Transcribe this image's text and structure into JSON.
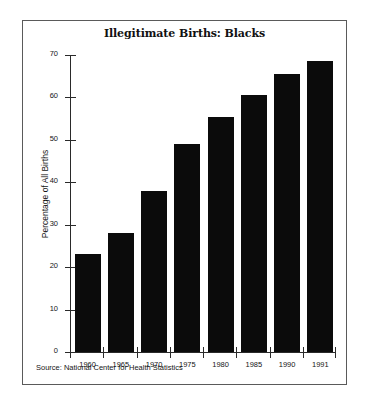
{
  "chart_data": {
    "type": "bar",
    "title": "Illegitimate Births: Blacks",
    "xlabel": "",
    "ylabel": "Percentage of All Births",
    "categories": [
      "1960",
      "1965",
      "1970",
      "1975",
      "1980",
      "1985",
      "1990",
      "1991"
    ],
    "values": [
      23,
      28,
      38,
      49,
      55.5,
      60.5,
      65.5,
      68.5
    ],
    "ylim": [
      0,
      70
    ],
    "yticks": [
      0,
      10,
      20,
      30,
      40,
      50,
      60,
      70
    ],
    "ytick_labels": [
      "0",
      "10",
      "20",
      "30",
      "40",
      "50",
      "60",
      "70"
    ],
    "grid": false,
    "legend": false,
    "bar_color": "#0b0b0b",
    "source": "Source: National Center for Health Statistics"
  }
}
